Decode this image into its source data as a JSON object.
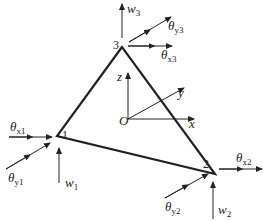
{
  "diagram": {
    "title": "",
    "colors": {
      "stroke": "#222222",
      "background": "#ffffff"
    },
    "element": "triangular plate element",
    "nodes": [
      {
        "id": "1",
        "label": "1"
      },
      {
        "id": "2",
        "label": "2"
      },
      {
        "id": "3",
        "label": "3"
      }
    ],
    "axes": {
      "origin": "O",
      "x": "x",
      "y": "y",
      "z": "z"
    },
    "dofs": {
      "node1": {
        "w": "w",
        "w_sub": "1",
        "tx": "θ",
        "tx_sub": "x1",
        "ty": "θ",
        "ty_sub": "y1"
      },
      "node2": {
        "w": "w",
        "w_sub": "2",
        "tx": "θ",
        "tx_sub": "x2",
        "ty": "θ",
        "ty_sub": "y2"
      },
      "node3": {
        "w": "w",
        "w_sub": "3",
        "tx": "θ",
        "tx_sub": "x3",
        "ty": "θ",
        "ty_sub": "y3"
      }
    }
  }
}
